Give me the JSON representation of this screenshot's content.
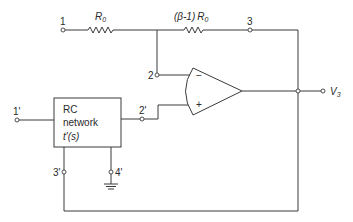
{
  "diagram": {
    "type": "circuit-schematic",
    "nodes": {
      "n1": "1",
      "n2": "2",
      "n3": "3",
      "n1p": "1'",
      "n2p": "2'",
      "n3p": "3'",
      "n4p": "4'"
    },
    "resistors": {
      "r1": {
        "symbol": "R",
        "subscript": "0"
      },
      "r2": {
        "prefix": "(β-1)",
        "symbol": "R",
        "subscript": "0"
      }
    },
    "opamp": {
      "inverting_sign": "−",
      "noninverting_sign": "+"
    },
    "rc_block": {
      "line1": "RC",
      "line2": "network",
      "line3": "t'(s)"
    },
    "output": {
      "symbol": "V",
      "subscript": "3"
    },
    "colors": {
      "line": "#3a3a3a",
      "background": "#ffffff"
    }
  }
}
